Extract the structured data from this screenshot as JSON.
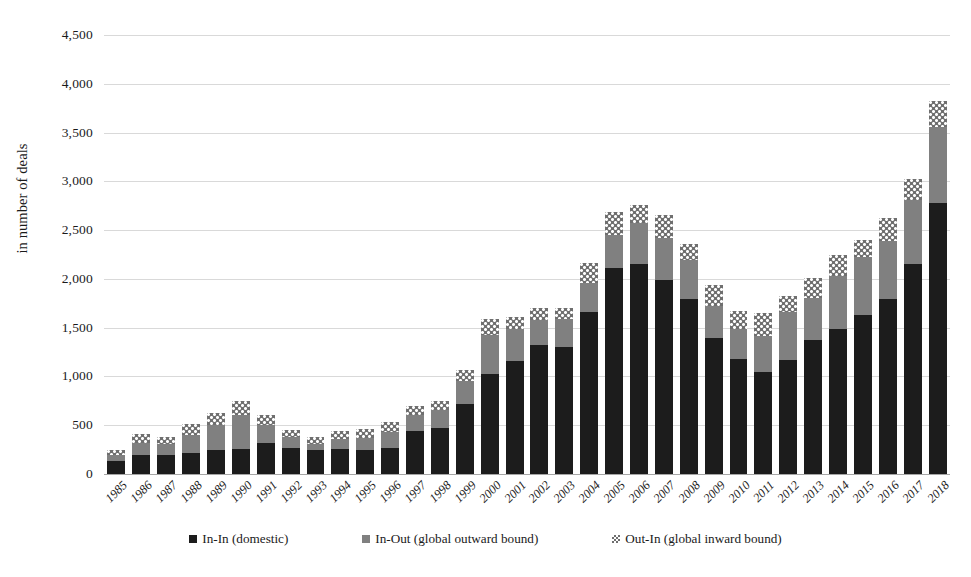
{
  "chart_data": {
    "type": "bar",
    "stacked": true,
    "title": "",
    "subtitle": "",
    "xlabel": "",
    "ylabel": "in number of deals",
    "ylim": [
      0,
      4500
    ],
    "ytick_step": 500,
    "ytick_labels": [
      "0",
      "500",
      "1,000",
      "1,500",
      "2,000",
      "2,500",
      "3,000",
      "3,500",
      "4,000",
      "4,500"
    ],
    "ytick_values": [
      0,
      500,
      1000,
      1500,
      2000,
      2500,
      3000,
      3500,
      4000,
      4500
    ],
    "grid": true,
    "legend_position": "bottom",
    "categories": [
      "1985",
      "1986",
      "1987",
      "1988",
      "1989",
      "1990",
      "1991",
      "1992",
      "1993",
      "1994",
      "1995",
      "1996",
      "1997",
      "1998",
      "1999",
      "2000",
      "2001",
      "2002",
      "2003",
      "2004",
      "2005",
      "2006",
      "2007",
      "2008",
      "2009",
      "2010",
      "2011",
      "2012",
      "2013",
      "2014",
      "2015",
      "2016",
      "2017",
      "2018"
    ],
    "series": [
      {
        "name": "In-In (domestic)",
        "color": "#1c1c1c",
        "pattern": "solid",
        "values": [
          130,
          190,
          200,
          215,
          250,
          255,
          320,
          270,
          245,
          260,
          250,
          265,
          440,
          470,
          720,
          1030,
          1160,
          1320,
          1300,
          1660,
          2110,
          2150,
          1990,
          1790,
          1390,
          1180,
          1050,
          1170,
          1370,
          1490,
          1630,
          1790,
          2150,
          2780
        ]
      },
      {
        "name": "In-Out (global outward bound)",
        "color": "#808080",
        "pattern": "solid",
        "values": [
          70,
          130,
          110,
          185,
          250,
          350,
          180,
          110,
          60,
          100,
          120,
          170,
          160,
          190,
          230,
          400,
          330,
          260,
          290,
          300,
          340,
          420,
          430,
          400,
          330,
          310,
          360,
          490,
          430,
          540,
          590,
          600,
          660,
          780
        ]
      },
      {
        "name": "Out-In (global inward bound)",
        "color": "#6f6f6f",
        "pattern": "checkered",
        "values": [
          50,
          90,
          70,
          110,
          130,
          140,
          110,
          70,
          70,
          80,
          90,
          100,
          100,
          90,
          120,
          160,
          120,
          120,
          110,
          200,
          240,
          190,
          240,
          170,
          220,
          180,
          240,
          160,
          210,
          220,
          180,
          230,
          210,
          260
        ]
      }
    ],
    "totals": [
      250,
      410,
      380,
      510,
      630,
      745,
      610,
      450,
      375,
      440,
      460,
      535,
      700,
      750,
      1070,
      1590,
      1610,
      1700,
      1700,
      2160,
      2690,
      2760,
      2660,
      2360,
      1940,
      1670,
      1650,
      1820,
      2010,
      2250,
      2400,
      2620,
      3020,
      3820
    ]
  },
  "legend": {
    "items": [
      {
        "label": "In-In (domestic)",
        "key": "in-in"
      },
      {
        "label": "In-Out (global outward bound)",
        "key": "in-out"
      },
      {
        "label": "Out-In (global inward bound)",
        "key": "out-in"
      }
    ]
  }
}
